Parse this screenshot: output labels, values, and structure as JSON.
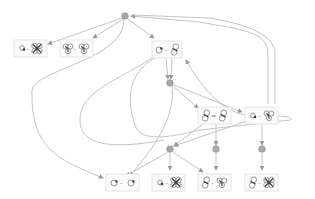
{
  "diagram": {
    "kind": "reaction-network graph",
    "colors": {
      "edge": "#c4c4c4",
      "junction": "#a9a9a9",
      "box_fill": "#fbfbfb",
      "box_stroke": "#dedede",
      "glyph": "#3a3a3a"
    },
    "junctions": [
      {
        "id": "j0",
        "x": 125,
        "y": 16
      },
      {
        "id": "j1",
        "x": 170,
        "y": 83
      },
      {
        "id": "j2",
        "x": 170,
        "y": 149
      },
      {
        "id": "j3",
        "x": 216,
        "y": 149
      },
      {
        "id": "j4",
        "x": 262,
        "y": 149
      }
    ],
    "nodes": [
      {
        "id": "n1",
        "x": 14,
        "y": 40,
        "left": "small-ring",
        "separator": "-",
        "right": "four-petal"
      },
      {
        "id": "n2",
        "x": 60,
        "y": 40,
        "left": "three-petal",
        "separator": "-",
        "right": "three-petal"
      },
      {
        "id": "n3",
        "x": 152,
        "y": 41,
        "left": "ring-dot",
        "separator": "-",
        "right": "figure-eight"
      },
      {
        "id": "n4",
        "x": 198,
        "y": 107,
        "left": "figure-eight",
        "separator": "=",
        "right": "figure-eight"
      },
      {
        "id": "n5",
        "x": 245,
        "y": 107,
        "left": "small-ring",
        "separator": "-",
        "right": "three-petal"
      },
      {
        "id": "n6",
        "x": 106,
        "y": 174,
        "left": "ring-dot",
        "separator": "-",
        "right": "ring-dot"
      },
      {
        "id": "n7",
        "x": 152,
        "y": 174,
        "left": "small-ring",
        "separator": "-",
        "right": "four-petal"
      },
      {
        "id": "n8",
        "x": 198,
        "y": 174,
        "left": "figure-eight",
        "separator": "-",
        "right": "three-petal"
      },
      {
        "id": "n9",
        "x": 245,
        "y": 174,
        "left": "figure-eight",
        "separator": "-",
        "right": "four-petal"
      }
    ],
    "edges": [
      {
        "from": "j0",
        "to": "n1"
      },
      {
        "from": "j0",
        "to": "n2"
      },
      {
        "from": "j0",
        "to": "n3"
      },
      {
        "from": "n3",
        "to": "j1"
      },
      {
        "from": "n3",
        "to": "j1"
      },
      {
        "from": "j0",
        "to": "n6"
      },
      {
        "from": "n5",
        "to": "j0"
      },
      {
        "from": "n5",
        "to": "j0"
      },
      {
        "from": "j1",
        "to": "n4"
      },
      {
        "from": "j1",
        "to": "n5"
      },
      {
        "from": "n4",
        "to": "j2"
      },
      {
        "from": "n4",
        "to": "j3"
      },
      {
        "from": "n5",
        "to": "j4"
      },
      {
        "from": "n5",
        "to": "n3"
      },
      {
        "from": "j2",
        "to": "n6"
      },
      {
        "from": "j2",
        "to": "n7"
      },
      {
        "from": "j2",
        "to": "n8"
      },
      {
        "from": "j3",
        "to": "n8"
      },
      {
        "from": "j4",
        "to": "n9"
      },
      {
        "from": "n3",
        "to": "n6"
      }
    ]
  }
}
